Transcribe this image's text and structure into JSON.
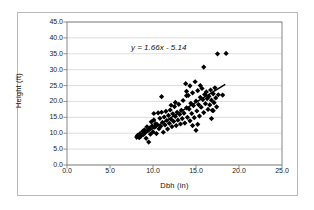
{
  "chart_data": {
    "type": "scatter",
    "title": "",
    "xlabel": "Dbh (in)",
    "ylabel": "Height (ft)",
    "xlim": [
      0,
      25
    ],
    "ylim": [
      0,
      45
    ],
    "xticks": [
      "0.0",
      "5.0",
      "10.0",
      "15.0",
      "20.0",
      "25.0"
    ],
    "yticks": [
      "0.0",
      "5.0",
      "10.0",
      "15.0",
      "20.0",
      "25.0",
      "30.0",
      "35.0",
      "40.0",
      "45.0"
    ],
    "grid": "horizontal",
    "legend": "none",
    "annotation": "y = 1.66x - 5.14",
    "trendline": {
      "slope": 1.66,
      "intercept": -5.14,
      "x_start": 8.0,
      "x_end": 18.4,
      "color": "#000000"
    },
    "marker": {
      "shape": "diamond",
      "color": "#000000",
      "size": 2.6
    },
    "points": [
      [
        8.1,
        8.8
      ],
      [
        8.2,
        9.3
      ],
      [
        8.4,
        8.6
      ],
      [
        8.5,
        9.9
      ],
      [
        8.6,
        9.1
      ],
      [
        8.8,
        10.6
      ],
      [
        8.9,
        9.6
      ],
      [
        9.0,
        11.1
      ],
      [
        9.1,
        10.2
      ],
      [
        9.2,
        8.4
      ],
      [
        9.3,
        12.0
      ],
      [
        9.4,
        10.8
      ],
      [
        9.5,
        7.2
      ],
      [
        9.6,
        11.6
      ],
      [
        9.7,
        9.7
      ],
      [
        9.8,
        13.6
      ],
      [
        9.9,
        12.3
      ],
      [
        10.0,
        10.4
      ],
      [
        10.1,
        14.2
      ],
      [
        10.2,
        11.9
      ],
      [
        10.3,
        13.0
      ],
      [
        10.4,
        9.9
      ],
      [
        10.5,
        12.7
      ],
      [
        10.6,
        16.4
      ],
      [
        10.7,
        11.4
      ],
      [
        10.8,
        14.7
      ],
      [
        10.9,
        12.2
      ],
      [
        11.0,
        21.5
      ],
      [
        11.1,
        13.4
      ],
      [
        11.2,
        10.3
      ],
      [
        11.3,
        15.1
      ],
      [
        11.4,
        12.6
      ],
      [
        11.5,
        16.9
      ],
      [
        11.6,
        14.0
      ],
      [
        11.7,
        11.3
      ],
      [
        11.8,
        15.6
      ],
      [
        11.9,
        13.1
      ],
      [
        12.0,
        17.3
      ],
      [
        12.1,
        14.4
      ],
      [
        12.2,
        12.1
      ],
      [
        12.3,
        16.1
      ],
      [
        12.4,
        13.7
      ],
      [
        12.5,
        18.4
      ],
      [
        12.6,
        15.3
      ],
      [
        12.7,
        12.4
      ],
      [
        12.8,
        16.6
      ],
      [
        12.9,
        14.1
      ],
      [
        13.0,
        19.1
      ],
      [
        13.1,
        15.9
      ],
      [
        13.2,
        12.9
      ],
      [
        13.3,
        17.2
      ],
      [
        13.4,
        14.6
      ],
      [
        13.5,
        20.3
      ],
      [
        13.6,
        16.3
      ],
      [
        13.7,
        13.2
      ],
      [
        13.8,
        25.6
      ],
      [
        13.9,
        18.0
      ],
      [
        14.0,
        15.0
      ],
      [
        14.1,
        21.9
      ],
      [
        14.2,
        17.6
      ],
      [
        14.3,
        13.9
      ],
      [
        14.4,
        19.4
      ],
      [
        14.5,
        16.2
      ],
      [
        14.6,
        22.7
      ],
      [
        14.7,
        18.7
      ],
      [
        14.8,
        14.9
      ],
      [
        14.9,
        26.2
      ],
      [
        15.0,
        20.1
      ],
      [
        15.1,
        17.0
      ],
      [
        15.2,
        23.4
      ],
      [
        15.3,
        19.0
      ],
      [
        15.4,
        15.4
      ],
      [
        15.5,
        21.3
      ],
      [
        15.6,
        18.2
      ],
      [
        15.7,
        24.1
      ],
      [
        15.8,
        20.6
      ],
      [
        15.9,
        16.5
      ],
      [
        15.0,
        10.9
      ],
      [
        14.6,
        12.4
      ],
      [
        15.2,
        12.8
      ],
      [
        16.0,
        22.2
      ],
      [
        16.1,
        19.3
      ],
      [
        16.2,
        23.0
      ],
      [
        16.3,
        20.9
      ],
      [
        16.4,
        17.5
      ],
      [
        16.5,
        21.6
      ],
      [
        16.6,
        18.9
      ],
      [
        16.7,
        23.6
      ],
      [
        16.8,
        20.4
      ],
      [
        16.9,
        17.2
      ],
      [
        17.0,
        22.4
      ],
      [
        17.1,
        19.6
      ],
      [
        17.2,
        24.3
      ],
      [
        17.3,
        21.1
      ],
      [
        17.4,
        18.3
      ],
      [
        15.9,
        30.8
      ],
      [
        17.5,
        35.0
      ],
      [
        18.5,
        35.1
      ],
      [
        17.6,
        22.1
      ],
      [
        18.1,
        22.0
      ],
      [
        13.9,
        23.2
      ],
      [
        13.9,
        21.8
      ],
      [
        12.1,
        18.8
      ],
      [
        11.0,
        16.6
      ],
      [
        10.1,
        16.2
      ],
      [
        12.6,
        19.7
      ],
      [
        14.3,
        24.9
      ],
      [
        15.5,
        25.0
      ],
      [
        16.8,
        14.6
      ],
      [
        17.0,
        17.1
      ]
    ]
  }
}
